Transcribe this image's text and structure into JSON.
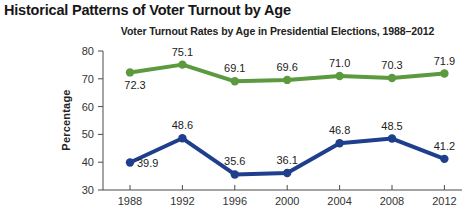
{
  "page": {
    "figure_title": "Historical Patterns of Voter Turnout by Age"
  },
  "chart_data": {
    "type": "line",
    "title": "Historical Patterns of Voter Turnout by Age",
    "subtitle": "Voter Turnout Rates by Age in Presidential Elections, 1988–2012",
    "xlabel": "",
    "ylabel": "Percentage",
    "x": [
      1988,
      1992,
      1996,
      2000,
      2004,
      2008,
      2012
    ],
    "series": [
      {
        "name": "upper-turnout",
        "color": "#5c9a40",
        "values": [
          72.3,
          75.1,
          69.1,
          69.6,
          71.0,
          70.3,
          71.9
        ]
      },
      {
        "name": "lower-turnout",
        "color": "#1f3e8c",
        "values": [
          39.9,
          48.6,
          35.6,
          36.1,
          46.8,
          48.5,
          41.2
        ]
      }
    ],
    "ylim": [
      30,
      80
    ],
    "yticks": [
      30,
      40,
      50,
      60,
      70,
      80
    ],
    "grid": false,
    "legend_position": "none",
    "data_labels": true
  }
}
